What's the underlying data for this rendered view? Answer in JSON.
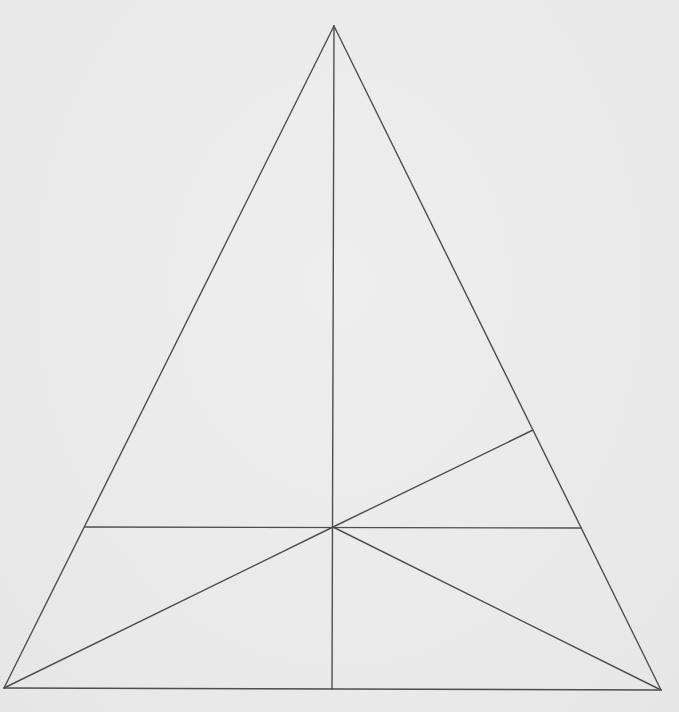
{
  "figure": {
    "type": "geometric-diagram",
    "line_color": "#4e4e4e",
    "background_color": "#ebebeb",
    "points": {
      "A": {
        "x": 334,
        "y": 26,
        "role": "apex"
      },
      "B": {
        "x": 4,
        "y": 688,
        "role": "bottom-left vertex"
      },
      "C": {
        "x": 661,
        "y": 690,
        "role": "bottom-right vertex"
      },
      "O": {
        "x": 333,
        "y": 527,
        "role": "interior intersection point"
      },
      "D": {
        "x": 332,
        "y": 689,
        "role": "foot of vertical on base"
      },
      "E": {
        "x": 85,
        "y": 527,
        "role": "horizontal line left end on AB"
      },
      "F": {
        "x": 581,
        "y": 528,
        "role": "horizontal line right end on AC"
      },
      "G": {
        "x": 533,
        "y": 430,
        "role": "point on AC above F"
      }
    },
    "segments": [
      {
        "id": "AB",
        "from": "A",
        "to": "B",
        "label": "left side"
      },
      {
        "id": "AC",
        "from": "A",
        "to": "C",
        "label": "right side"
      },
      {
        "id": "BC",
        "from": "B",
        "to": "C",
        "label": "base"
      },
      {
        "id": "AD",
        "from": "A",
        "to": "D",
        "label": "vertical line from apex to base"
      },
      {
        "id": "EF",
        "from": "E",
        "to": "F",
        "label": "horizontal line"
      },
      {
        "id": "OB",
        "from": "O",
        "to": "B",
        "label": "segment to bottom-left vertex"
      },
      {
        "id": "OC",
        "from": "O",
        "to": "C",
        "label": "segment to bottom-right vertex"
      },
      {
        "id": "OG",
        "from": "O",
        "to": "G",
        "label": "segment to right side"
      }
    ]
  }
}
